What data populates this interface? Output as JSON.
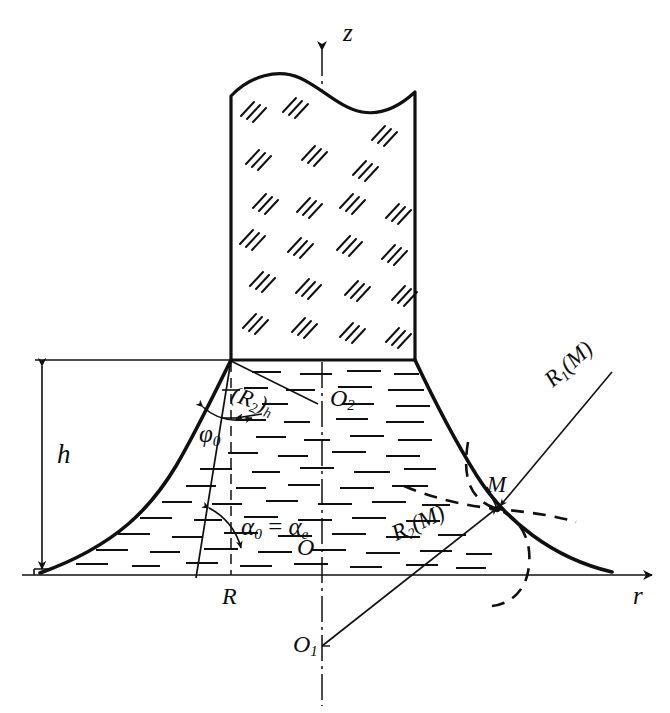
{
  "figure": {
    "kind": "meniscus-geometry-diagram"
  },
  "axes": {
    "vertical": {
      "name": "z-axis",
      "label": "z",
      "style": "dash-dot centerline with arrow"
    },
    "horizontal": {
      "name": "r-axis",
      "label": "r",
      "style": "solid with arrow"
    },
    "origin_label": "O"
  },
  "labels": {
    "z_axis": "z",
    "r_axis": "r",
    "origin": "O",
    "height": "h",
    "radius_R": "R",
    "center_O1": "O",
    "center_O1_sub": "1",
    "center_O2": "O",
    "center_O2_sub": "2",
    "point_M": "M",
    "phi_zero": "φ",
    "phi_zero_sub": "0",
    "alpha_equation": "α",
    "alpha_sub_0": "0",
    "alpha_eq_sign": "=",
    "alpha_e": "α",
    "alpha_e_sub": "e",
    "R2_h_open": "(",
    "R2_h_R": "R",
    "R2_h_sub2": "2",
    "R2_h_close": ")",
    "R2_h_subh": "h",
    "R1_M": "R",
    "R1_M_sub": "1",
    "R1_M_arg": "(M)",
    "R2_M": "R",
    "R2_M_sub": "2",
    "R2_M_arg": "(M)"
  },
  "geometry": {
    "r_axis_y": 575,
    "z_axis_x": 322,
    "column_left_x": 231,
    "column_right_x": 415,
    "column_base_y": 360,
    "column_top_y": 78,
    "meniscus_left_end_x": 40,
    "meniscus_right_end_x": 612,
    "point_M": {
      "x": 497,
      "y": 508
    },
    "O1": {
      "x": 322,
      "y": 646
    },
    "O2": {
      "x": 322,
      "y": 404
    },
    "height_dim_x": 42
  },
  "colors": {
    "ink": "#101010",
    "background": "#ffffff",
    "thin_line": "#1a1a1a"
  },
  "hatching": {
    "solid_region": "triple short diagonal strokes (solid / crystal)",
    "liquid_region": "short horizontal dashes (liquid)"
  }
}
